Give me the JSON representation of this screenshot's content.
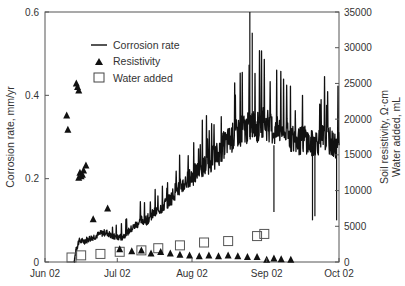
{
  "chart_data": {
    "type": "line",
    "title": "",
    "xlabel": "",
    "ylabel_left": "Corrosion rate, mm/yr",
    "ylabel_right": [
      "Soil resistivity, Ω·cm",
      "Water added, mL"
    ],
    "x_ticks": [
      "Jun 02",
      "Jul 02",
      "Aug 02",
      "Sep 02",
      "Oct 02"
    ],
    "x_range_days": [
      0,
      122
    ],
    "x_tick_days": [
      0,
      30,
      61,
      92,
      122
    ],
    "ylim_left": [
      0,
      0.6
    ],
    "y_ticks_left": [
      "0",
      "0.2",
      "0.4",
      "0.6"
    ],
    "y_tick_values_left": [
      0,
      0.2,
      0.4,
      0.6
    ],
    "ylim_right": [
      0,
      35000
    ],
    "y_ticks_right": [
      "0",
      "5000",
      "10000",
      "15000",
      "20000",
      "25000",
      "30000",
      "35000"
    ],
    "y_tick_values_right": [
      0,
      5000,
      10000,
      15000,
      20000,
      25000,
      30000,
      35000
    ],
    "grid": false,
    "legend_position": "upper-left-inside",
    "legend": [
      {
        "label": "Corrosion rate",
        "marker": "line"
      },
      {
        "label": "Resistivity",
        "marker": "filled-triangle"
      },
      {
        "label": "Water added",
        "marker": "open-square"
      }
    ],
    "series": [
      {
        "name": "Corrosion rate",
        "axis": "left",
        "style": "line",
        "color": "#111111",
        "x_days": [
          12,
          13,
          14,
          16,
          18,
          20,
          22,
          24,
          26,
          28,
          30,
          32,
          34,
          36,
          38,
          40,
          42,
          44,
          46,
          48,
          50,
          52,
          54,
          56,
          58,
          60,
          62,
          64,
          66,
          68,
          70,
          72,
          74,
          76,
          78,
          80,
          82,
          84,
          86,
          88,
          90,
          92,
          94,
          96,
          98,
          100,
          102,
          104,
          106,
          108,
          110,
          112,
          114,
          116,
          118,
          120,
          122
        ],
        "values": [
          0.0,
          0.03,
          0.05,
          0.05,
          0.055,
          0.06,
          0.065,
          0.07,
          0.07,
          0.06,
          0.06,
          0.06,
          0.07,
          0.08,
          0.09,
          0.1,
          0.1,
          0.11,
          0.12,
          0.13,
          0.14,
          0.15,
          0.17,
          0.18,
          0.19,
          0.2,
          0.21,
          0.22,
          0.23,
          0.24,
          0.25,
          0.26,
          0.28,
          0.29,
          0.3,
          0.31,
          0.32,
          0.32,
          0.33,
          0.32,
          0.34,
          0.33,
          0.32,
          0.31,
          0.32,
          0.31,
          0.3,
          0.29,
          0.29,
          0.3,
          0.28,
          0.29,
          0.29,
          0.3,
          0.29,
          0.28,
          0.28
        ],
        "notable_spikes": [
          {
            "x_day": 85,
            "value": 0.6
          },
          {
            "x_day": 86,
            "value": 0.55
          }
        ],
        "notable_dips_right_axis_equiv": [
          {
            "x_day": 95,
            "value": 0.12
          },
          {
            "x_day": 111,
            "value": 0.1
          },
          {
            "x_day": 112,
            "value": 0.11
          },
          {
            "x_day": 121,
            "value": 0.1
          }
        ]
      },
      {
        "name": "Resistivity",
        "axis": "right",
        "style": "scatter",
        "marker": "filled-triangle",
        "color": "#111111",
        "x_days": [
          9,
          9.5,
          13,
          13.5,
          14,
          14.5,
          14,
          15,
          15.5,
          16,
          17,
          20,
          26,
          31,
          36,
          40,
          44,
          48,
          52,
          56,
          60,
          64,
          68,
          72,
          76,
          80,
          84,
          88,
          92,
          95,
          98,
          102
        ],
        "values": [
          20500,
          18500,
          25000,
          24500,
          24000,
          12500,
          11800,
          12000,
          12200,
          12800,
          13500,
          6000,
          7500,
          1800,
          1500,
          1600,
          1200,
          1400,
          1200,
          1000,
          900,
          800,
          900,
          800,
          900,
          800,
          700,
          700,
          300,
          500,
          400,
          300
        ]
      },
      {
        "name": "Water added",
        "axis": "right",
        "style": "scatter",
        "marker": "open-square",
        "color": "#555555",
        "x_days": [
          11,
          15,
          23,
          31,
          40,
          47,
          56,
          66,
          76,
          88,
          91
        ],
        "values": [
          0,
          300,
          500,
          800,
          1000,
          1300,
          1700,
          2100,
          2300,
          3000,
          3300
        ]
      }
    ]
  }
}
